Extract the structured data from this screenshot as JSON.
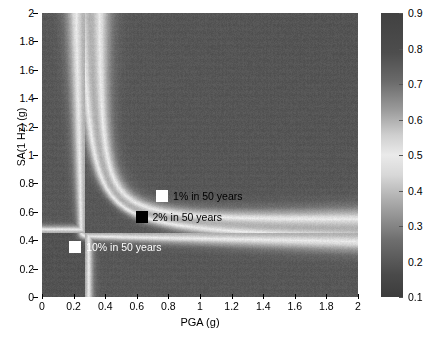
{
  "chart_data": {
    "type": "heatmap",
    "title": "",
    "xlabel": "PGA (g)",
    "ylabel": "SA(1 Hz) (g)",
    "xlim": [
      0,
      2
    ],
    "ylim": [
      0,
      2
    ],
    "xticks": [
      0,
      0.2,
      0.4,
      0.6,
      0.8,
      1,
      1.2,
      1.4,
      1.6,
      1.8,
      2
    ],
    "xticklabels": [
      "0",
      "0.2",
      "0.4",
      "0.6",
      "0.8",
      "1",
      "1.2",
      "1.4",
      "1.6",
      "1.8",
      "2"
    ],
    "yticks": [
      0,
      0.2,
      0.4,
      0.6,
      0.8,
      1,
      1.2,
      1.4,
      1.6,
      1.8,
      2
    ],
    "yticklabels": [
      "0",
      "0.2",
      "0.4",
      "0.6",
      "0.8",
      "1",
      "1.2",
      "1.4",
      "1.6",
      "1.8",
      "2"
    ],
    "grid": false,
    "colormap": "grayscale",
    "colorbar": {
      "min": 0.1,
      "max": 0.9,
      "ticks": [
        0.9,
        0.8,
        0.7,
        0.6,
        0.5,
        0.4,
        0.3,
        0.2,
        0.1
      ],
      "ticklabels": [
        "0.9",
        "0.8",
        "0.7",
        "0.6",
        "0.5",
        "0.4",
        "0.3",
        "0.2",
        "0.1"
      ],
      "position": "right",
      "orientation": "vertical",
      "bright_value": 0.55,
      "background_value": 0.2
    },
    "ridge": {
      "description": "L-shaped bright hyperbolic ridge of high correlation / joint-exceedance value",
      "vertical_asymptote_pga": 0.27,
      "horizontal_asymptote_sa": 0.45,
      "peak_value": 0.6
    },
    "annotations": [
      {
        "label": "1% in 50 years",
        "marker": "square",
        "marker_color": "#ffffff",
        "text_color": "#000000",
        "pga": 0.76,
        "sa": 0.71
      },
      {
        "label": "2% in 50 years",
        "marker": "square",
        "marker_color": "#000000",
        "text_color": "#000000",
        "pga": 0.63,
        "sa": 0.56
      },
      {
        "label": "10% in 50 years",
        "marker": "square",
        "marker_color": "#ffffff",
        "text_color": "#ffffff",
        "pga": 0.21,
        "sa": 0.35
      }
    ]
  },
  "axes": {
    "y_title": "SA(1 Hz) (g)",
    "x_title": "PGA (g)",
    "y_ticks": [
      {
        "value": 2,
        "label": "2"
      },
      {
        "value": 1.8,
        "label": "1.8"
      },
      {
        "value": 1.6,
        "label": "1.6"
      },
      {
        "value": 1.4,
        "label": "1.4"
      },
      {
        "value": 1.2,
        "label": "1.2"
      },
      {
        "value": 1,
        "label": "1"
      },
      {
        "value": 0.8,
        "label": "0.8"
      },
      {
        "value": 0.6,
        "label": "0.6"
      },
      {
        "value": 0.4,
        "label": "0.4"
      },
      {
        "value": 0.2,
        "label": "0.2"
      },
      {
        "value": 0,
        "label": "0"
      }
    ],
    "x_ticks": [
      {
        "value": 0,
        "label": "0"
      },
      {
        "value": 0.2,
        "label": "0.2"
      },
      {
        "value": 0.4,
        "label": "0.4"
      },
      {
        "value": 0.6,
        "label": "0.6"
      },
      {
        "value": 0.8,
        "label": "0.8"
      },
      {
        "value": 1,
        "label": "1"
      },
      {
        "value": 1.2,
        "label": "1.2"
      },
      {
        "value": 1.4,
        "label": "1.4"
      },
      {
        "value": 1.6,
        "label": "1.6"
      },
      {
        "value": 1.8,
        "label": "1.8"
      },
      {
        "value": 2,
        "label": "2"
      }
    ]
  },
  "colorbar_ticks": [
    {
      "value": 0.9,
      "label": "0.9"
    },
    {
      "value": 0.8,
      "label": "0.8"
    },
    {
      "value": 0.7,
      "label": "0.7"
    },
    {
      "value": 0.6,
      "label": "0.6"
    },
    {
      "value": 0.5,
      "label": "0.5"
    },
    {
      "value": 0.4,
      "label": "0.4"
    },
    {
      "value": 0.3,
      "label": "0.3"
    },
    {
      "value": 0.2,
      "label": "0.2"
    },
    {
      "value": 0.1,
      "label": "0.1"
    }
  ],
  "annotations": [
    {
      "label": "1% in 50 years",
      "swatch": "white",
      "text_on_dark": false
    },
    {
      "label": "2% in 50 years",
      "swatch": "black",
      "text_on_dark": false
    },
    {
      "label": "10% in 50 years",
      "swatch": "white",
      "text_on_dark": true
    }
  ],
  "caption": ""
}
